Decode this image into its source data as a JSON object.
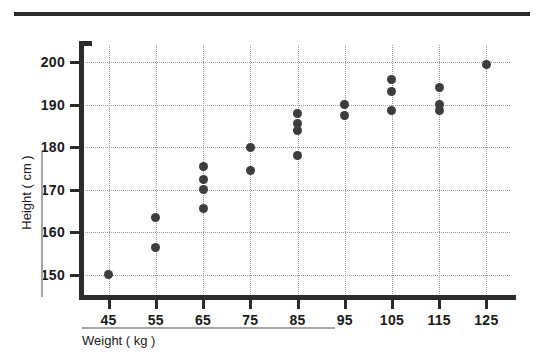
{
  "chart_data": {
    "type": "scatter",
    "title": "",
    "xlabel": "Weight ( kg )",
    "ylabel": "Height ( cm )",
    "xlim": [
      40,
      130
    ],
    "ylim": [
      145,
      204
    ],
    "xticks": [
      45,
      55,
      65,
      75,
      85,
      95,
      105,
      115,
      125
    ],
    "xtick_labels": [
      "45",
      "55",
      "65",
      "75",
      "85",
      "95",
      "105",
      "115",
      "125"
    ],
    "yticks": [
      150,
      160,
      170,
      180,
      190,
      200
    ],
    "ytick_labels": [
      "150",
      "160",
      "170",
      "180",
      "190",
      "200"
    ],
    "grid": true,
    "grid_style": "dotted",
    "legend": false,
    "marker": "filled-circle",
    "marker_color": "#3d3d3d",
    "axis_color": "#2b2b2b",
    "grid_color": "#9a9a9a",
    "points": [
      {
        "x": 45,
        "y": 150.0
      },
      {
        "x": 55,
        "y": 163.5
      },
      {
        "x": 55,
        "y": 156.5
      },
      {
        "x": 65,
        "y": 175.5
      },
      {
        "x": 65,
        "y": 172.5
      },
      {
        "x": 65,
        "y": 170.0
      },
      {
        "x": 65,
        "y": 165.5
      },
      {
        "x": 75,
        "y": 180.0
      },
      {
        "x": 75,
        "y": 174.5
      },
      {
        "x": 85,
        "y": 188.0
      },
      {
        "x": 85,
        "y": 185.5
      },
      {
        "x": 85,
        "y": 184.0
      },
      {
        "x": 85,
        "y": 178.0
      },
      {
        "x": 95,
        "y": 190.0
      },
      {
        "x": 95,
        "y": 187.5
      },
      {
        "x": 105,
        "y": 196.0
      },
      {
        "x": 105,
        "y": 193.0
      },
      {
        "x": 105,
        "y": 188.5
      },
      {
        "x": 115,
        "y": 194.0
      },
      {
        "x": 115,
        "y": 190.0
      },
      {
        "x": 115,
        "y": 188.5
      },
      {
        "x": 125,
        "y": 199.5
      }
    ]
  },
  "decor": {
    "top_rule_color": "#2b2b2b",
    "label_rule_color": "#a6a6a6"
  }
}
